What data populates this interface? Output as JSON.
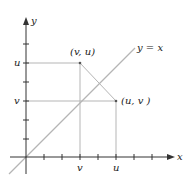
{
  "diagram": {
    "axes": {
      "x_label": "x",
      "y_label": "y"
    },
    "line_label": "y = x",
    "point_vu_label": "(v, u)",
    "point_uv_label": "(u, v )",
    "x_tick_labels": {
      "v": "v",
      "u": "u"
    },
    "y_tick_labels": {
      "u": "u",
      "v": "v"
    },
    "colors": {
      "axis": "#333333",
      "guide": "#b0b0b0",
      "diagonal": "#b0b0b0"
    }
  }
}
